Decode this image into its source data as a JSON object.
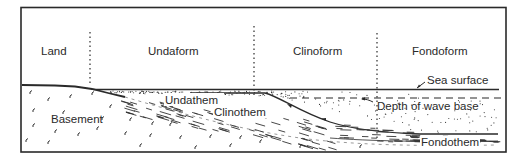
{
  "diagram": {
    "type": "geologic-cross-section",
    "zones": [
      {
        "id": "land",
        "label": "Land"
      },
      {
        "id": "undaform",
        "label": "Undaform"
      },
      {
        "id": "clinoform",
        "label": "Clinoform"
      },
      {
        "id": "fondoform",
        "label": "Fondoform"
      }
    ],
    "units": {
      "basement": "Basement",
      "undathem": "Undathem",
      "clinothem": "Clinothem",
      "fondothem": "Fondothem"
    },
    "annotations": {
      "sea_surface": "Sea surface",
      "wave_base": "Depth of wave base"
    },
    "colors": {
      "ink": "#2a2a2a",
      "background": "#ffffff"
    }
  }
}
